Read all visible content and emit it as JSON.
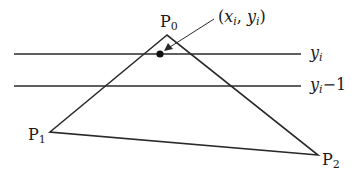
{
  "diagram": {
    "type": "scanline-triangle",
    "colors": {
      "stroke": "#2a2a2a",
      "background": "#ffffff"
    },
    "vertices": {
      "P0": {
        "label": "P",
        "subscript": "0",
        "x": 167,
        "y": 35
      },
      "P1": {
        "label": "P",
        "subscript": "1",
        "x": 50,
        "y": 132
      },
      "P2": {
        "label": "P",
        "subscript": "2",
        "x": 318,
        "y": 155
      }
    },
    "scanlines": [
      {
        "label_main": "y",
        "label_sub": "i",
        "label_suffix": "",
        "y": 54
      },
      {
        "label_main": "y",
        "label_sub": "i",
        "label_suffix": "−1",
        "y": 86
      }
    ],
    "point": {
      "label_open": "(",
      "x_main": "x",
      "x_sub": "i",
      "sep": ", ",
      "y_main": "y",
      "y_sub": "i",
      "label_close": ")",
      "x": 160,
      "y": 54
    }
  }
}
